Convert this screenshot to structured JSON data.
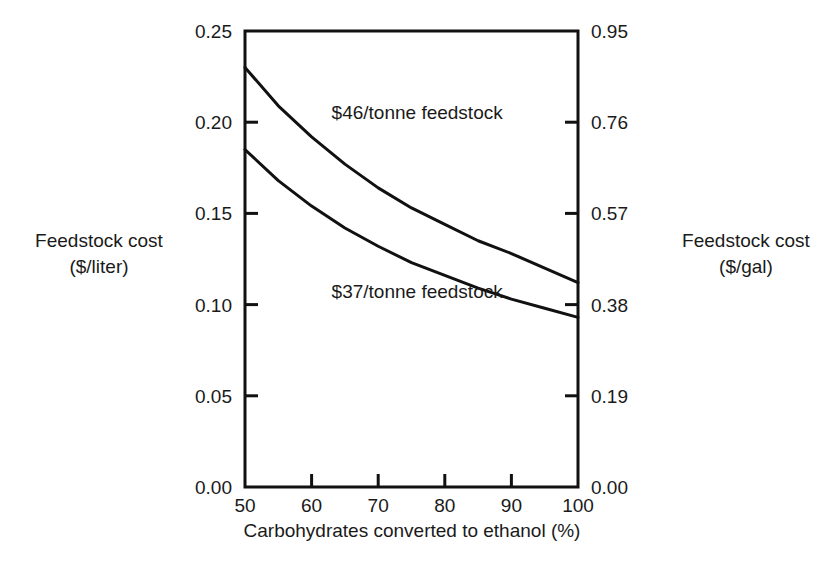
{
  "chart_data": {
    "type": "line",
    "title": "",
    "xlabel": "Carbohydrates converted to ethanol (%)",
    "ylabel": "Feedstock cost ($/liter)",
    "ylabel_right": "Feedstock cost ($/gal)",
    "xlim": [
      50,
      100
    ],
    "ylim": [
      0.0,
      0.25
    ],
    "ylim_right": [
      0.0,
      0.95
    ],
    "grid": false,
    "legend_position": "inline-annotations",
    "xticks": [
      50,
      60,
      70,
      80,
      90,
      100
    ],
    "xtick_labels": [
      "50",
      "60",
      "70",
      "80",
      "90",
      "100"
    ],
    "yticks": [
      0.0,
      0.05,
      0.1,
      0.15,
      0.2,
      0.25
    ],
    "ytick_labels": [
      "0.00",
      "0.05",
      "0.10",
      "0.15",
      "0.20",
      "0.25"
    ],
    "yticks_right": [
      0.0,
      0.19,
      0.38,
      0.57,
      0.76,
      0.95
    ],
    "ytick_labels_right": [
      "0.00",
      "0.19",
      "0.38",
      "0.57",
      "0.76",
      "0.95"
    ],
    "x": [
      50,
      55,
      60,
      65,
      70,
      75,
      80,
      85,
      90,
      95,
      100
    ],
    "series": [
      {
        "name": "$46/tonne feedstock",
        "label": "$46/tonne feedstock",
        "values": [
          0.23,
          0.209,
          0.192,
          0.177,
          0.164,
          0.153,
          0.144,
          0.135,
          0.128,
          0.12,
          0.112
        ]
      },
      {
        "name": "$37/tonne feedstock",
        "label": "$37/tonne feedstock",
        "values": [
          0.185,
          0.168,
          0.154,
          0.142,
          0.132,
          0.123,
          0.116,
          0.109,
          0.103,
          0.098,
          0.093
        ]
      }
    ],
    "annotations": [
      {
        "text": "$46/tonne feedstock",
        "x": 63,
        "y": 0.205
      },
      {
        "text": "$37/tonne feedstock",
        "x": 63,
        "y": 0.107
      }
    ],
    "line_color": "#111111",
    "axis_color": "#111111",
    "background": "#ffffff"
  }
}
